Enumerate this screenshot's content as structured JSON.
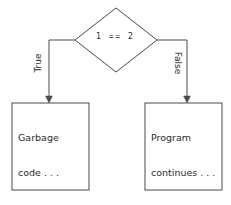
{
  "diagram": {
    "type": "flowchart",
    "stroke_color": "#4a4a4a",
    "text_color": "#2b2b2b",
    "background_color": "#ffffff",
    "decision": {
      "shape": "diamond",
      "condition": "1 == 2"
    },
    "edges": [
      {
        "label": "True",
        "from": "decision",
        "to": "garbage-node",
        "direction": "left"
      },
      {
        "label": "False",
        "from": "decision",
        "to": "continue-node",
        "direction": "right"
      }
    ],
    "nodes": [
      {
        "id": "garbage-node",
        "shape": "rectangle",
        "line1": "Garbage",
        "line2": "code . . ."
      },
      {
        "id": "continue-node",
        "shape": "rectangle",
        "line1": "Program",
        "line2": "continues . . ."
      }
    ]
  }
}
